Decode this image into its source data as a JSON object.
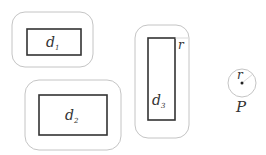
{
  "diagram": {
    "type": "geometric-illustration",
    "colors": {
      "outer_boundary": "#bdbdbd",
      "inner_rect": "#333333",
      "text": "#333333"
    },
    "regions": [
      {
        "id": "d1",
        "label": "d",
        "subscript": "1"
      },
      {
        "id": "d2",
        "label": "d",
        "subscript": "2"
      },
      {
        "id": "d3",
        "label": "d",
        "subscript": "3",
        "offset_label": "r"
      }
    ],
    "point": {
      "label": "P",
      "radius_label": "r"
    }
  }
}
